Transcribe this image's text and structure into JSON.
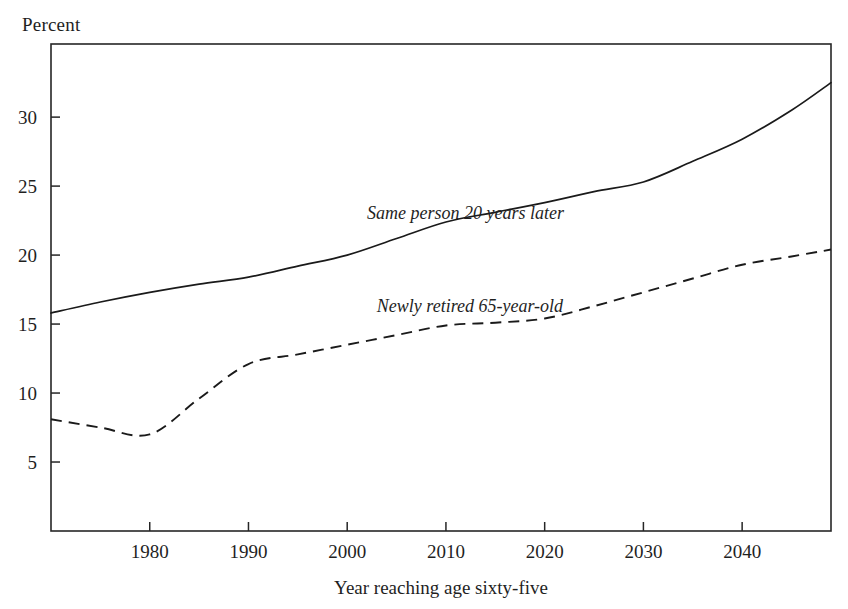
{
  "chart_data": {
    "type": "line",
    "title": "",
    "subtitle": "",
    "xlabel": "Year reaching age sixty-five",
    "ylabel": "Percent",
    "ylabel_position": "top-left",
    "grid": false,
    "legend": "inline-annotations",
    "xlim": [
      1970,
      2049
    ],
    "ylim": [
      0,
      35.3
    ],
    "xticks": [
      1980,
      1990,
      2000,
      2010,
      2020,
      2030,
      2040
    ],
    "xtick_labels": [
      "1980",
      "1990",
      "2000",
      "2010",
      "2020",
      "2030",
      "2040"
    ],
    "yticks": [
      5,
      10,
      15,
      20,
      25,
      30
    ],
    "ytick_labels": [
      "5",
      "10",
      "15",
      "20",
      "25",
      "30"
    ],
    "tick_direction": "inward",
    "x": [
      1970,
      1975,
      1980,
      1985,
      1990,
      1995,
      2000,
      2005,
      2010,
      2015,
      2020,
      2025,
      2030,
      2035,
      2040,
      2045,
      2049
    ],
    "series": [
      {
        "name": "Same person 20 years later",
        "style": "solid",
        "color": "#1a1a1a",
        "annotation_x": 2002,
        "annotation_y": 22.6,
        "values": [
          15.8,
          16.6,
          17.3,
          17.9,
          18.4,
          19.2,
          20.0,
          21.2,
          22.4,
          23.1,
          23.8,
          24.6,
          25.3,
          26.8,
          28.4,
          30.5,
          32.5
        ]
      },
      {
        "name": "Newly retired 65-year-old",
        "style": "dashed",
        "color": "#1a1a1a",
        "annotation_x": 2003,
        "annotation_y": 15.9,
        "values": [
          8.1,
          7.5,
          7.0,
          9.6,
          12.1,
          12.8,
          13.5,
          14.2,
          14.9,
          15.1,
          15.4,
          16.3,
          17.3,
          18.3,
          19.3,
          19.9,
          20.4
        ]
      }
    ]
  },
  "axes": {
    "y_unit_label": "Percent",
    "x_title": "Year reaching age sixty-five"
  }
}
